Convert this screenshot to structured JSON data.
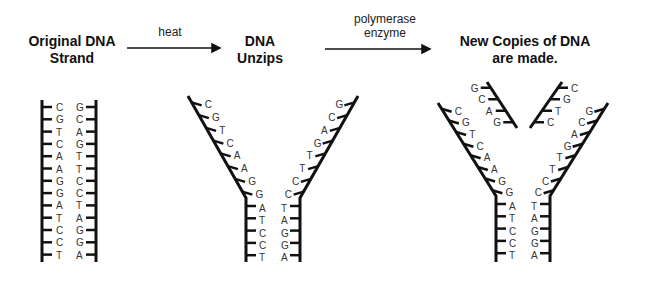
{
  "titles": {
    "original": [
      "Original DNA",
      "Strand"
    ],
    "unzips": [
      "DNA",
      "Unzips"
    ],
    "copies": [
      "New Copies of DNA",
      "are made."
    ]
  },
  "arrows": {
    "heat": "heat",
    "polymerase": [
      "polymerase",
      "enzyme"
    ]
  },
  "strands": {
    "original_left": [
      "C",
      "G",
      "T",
      "C",
      "A",
      "A",
      "G",
      "G",
      "A",
      "T",
      "C",
      "C",
      "T"
    ],
    "original_right": [
      "G",
      "C",
      "A",
      "G",
      "T",
      "T",
      "C",
      "C",
      "T",
      "A",
      "G",
      "G",
      "A"
    ],
    "new_left_complement": [
      "G",
      "C",
      "A",
      "G"
    ],
    "new_right_complement": [
      "C",
      "G",
      "T",
      "C"
    ]
  },
  "colors": {
    "strand": "#111111",
    "text": "#333333"
  }
}
